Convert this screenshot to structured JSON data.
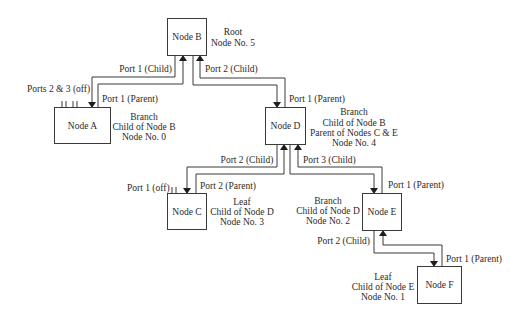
{
  "nodes": {
    "B": {
      "label": "Node B",
      "info": [
        "Root",
        "Node No. 5"
      ]
    },
    "A": {
      "label": "Node A",
      "info": [
        "Branch",
        "Child of Node B",
        "Node No. 0"
      ]
    },
    "D": {
      "label": "Node D",
      "info": [
        "Branch",
        "Child of Node B",
        "Parent of Nodes C & E",
        "Node No. 4"
      ]
    },
    "C": {
      "label": "Node C",
      "info": [
        "Leaf",
        "Child of Node D",
        "Node No. 3"
      ]
    },
    "E": {
      "label": "Node E",
      "info": [
        "Branch",
        "Child of Node D",
        "Node No. 2"
      ]
    },
    "F": {
      "label": "Node F",
      "info": [
        "Leaf",
        "Child of Node E",
        "Node No. 1"
      ]
    }
  },
  "ports": {
    "b_port1_child": "Port 1 (Child)",
    "b_port2_child": "Port 2 (Child)",
    "a_port1_parent": "Port 1 (Parent)",
    "a_ports_off": "Ports 2 & 3 (off)",
    "d_port1_parent": "Port 1 (Parent)",
    "d_port2_child": "Port 2 (Child)",
    "d_port3_child": "Port 3 (Child)",
    "c_port1_off": "Port 1 (off)",
    "c_port2_parent": "Port 2 (Parent)",
    "e_port1_parent": "Port 1 (Parent)",
    "e_port2_child": "Port 2 (Child)",
    "f_port1_parent": "Port 1 (Parent)"
  },
  "colors": {
    "line": "#3a3a3a",
    "text": "#2a2a2a",
    "background": "#ffffff"
  }
}
